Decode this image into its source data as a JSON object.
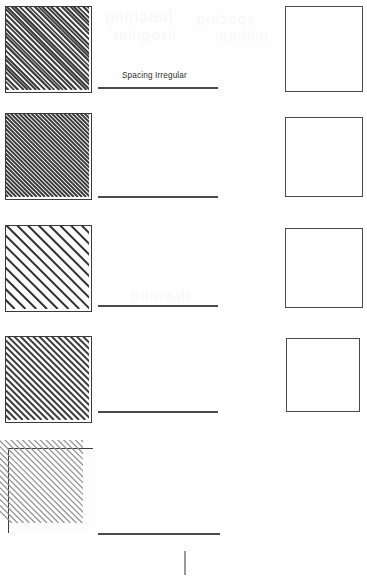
{
  "page": {
    "background_color": "#fefefe",
    "width": 367,
    "height": 576
  },
  "labels": [
    {
      "id": "spacing-irregular",
      "text": "Spacing Irregular",
      "x": 122,
      "y": 72,
      "color": "#2e2e2e"
    }
  ],
  "samples": [
    {
      "id": "sample-1",
      "name": "hatch-sample-1",
      "x": 5,
      "y": 6,
      "size": 87,
      "angle": 45,
      "spacing": 4.6,
      "line_width": 2.0,
      "line_color": "#3a3a3a",
      "fill_color": "#fbfbfb",
      "border_color": "#3b3b3b",
      "irregular": true,
      "overshoot": 0,
      "description": "Dense diagonal hatching with irregular spacing"
    },
    {
      "id": "sample-2",
      "name": "hatch-sample-2",
      "x": 5,
      "y": 113,
      "size": 87,
      "angle": 45,
      "spacing": 4.2,
      "line_width": 2.0,
      "line_color": "#3a3a3a",
      "fill_color": "#fbfbfb",
      "border_color": "#3b3b3b",
      "irregular": false,
      "overshoot": 0,
      "description": "Dense uniform diagonal hatching"
    },
    {
      "id": "sample-3",
      "name": "hatch-sample-3",
      "x": 5,
      "y": 225,
      "size": 87,
      "angle": 45,
      "spacing": 11.0,
      "line_width": 2.0,
      "line_color": "#2f2f2f",
      "fill_color": "#fbfbfb",
      "border_color": "#3b3b3b",
      "irregular": false,
      "overshoot": 0,
      "description": "Wide-spaced uniform diagonal hatching"
    },
    {
      "id": "sample-4",
      "name": "hatch-sample-4",
      "x": 5,
      "y": 336,
      "size": 87,
      "angle": 45,
      "spacing": 6.4,
      "line_width": 2.0,
      "line_color": "#3a3a3a",
      "fill_color": "#fbfbfb",
      "border_color": "#3b3b3b",
      "irregular": false,
      "overshoot": 0,
      "description": "Medium-spaced uniform diagonal hatching"
    },
    {
      "id": "sample-5",
      "name": "hatch-sample-5",
      "x": 8,
      "y": 448,
      "size": 85,
      "angle": 45,
      "spacing": 7.0,
      "line_width": 1.4,
      "line_color": "#8e8e8e",
      "fill_color": "#fdfdfd",
      "border_color": "#404040",
      "irregular": false,
      "overshoot": 7,
      "description": "Light hatching with lines overrunning the boundary"
    }
  ],
  "empty_boxes": [
    {
      "id": "answer-box-1",
      "name": "empty-answer-box-1",
      "x": 285,
      "y": 6,
      "width": 78,
      "height": 86
    },
    {
      "id": "answer-box-2",
      "name": "empty-answer-box-2",
      "x": 285,
      "y": 117,
      "width": 78,
      "height": 80
    },
    {
      "id": "answer-box-3",
      "name": "empty-answer-box-3",
      "x": 285,
      "y": 228,
      "width": 78,
      "height": 80
    },
    {
      "id": "answer-box-4",
      "name": "empty-answer-box-4",
      "x": 286,
      "y": 338,
      "width": 74,
      "height": 74
    }
  ],
  "rules": [
    {
      "id": "rule-1",
      "name": "answer-rule-1",
      "x": 98,
      "y": 87,
      "width": 120
    },
    {
      "id": "rule-2",
      "name": "answer-rule-2",
      "x": 98,
      "y": 196,
      "width": 120
    },
    {
      "id": "rule-3",
      "name": "answer-rule-3",
      "x": 98,
      "y": 305,
      "width": 120
    },
    {
      "id": "rule-4",
      "name": "answer-rule-4",
      "x": 98,
      "y": 411,
      "width": 120
    },
    {
      "id": "rule-5",
      "name": "answer-rule-5",
      "x": 98,
      "y": 533,
      "width": 122
    }
  ],
  "caret": {
    "name": "text-caret",
    "x": 184,
    "y": 551,
    "height": 24,
    "color": "#9a9a9a"
  },
  "ghosting": [
    {
      "text": "hatching",
      "x": 104,
      "y": 8,
      "size": 16
    },
    {
      "text": "spacing",
      "x": 196,
      "y": 10,
      "size": 15
    },
    {
      "text": "irregular",
      "x": 112,
      "y": 26,
      "size": 15
    },
    {
      "text": "uniform",
      "x": 214,
      "y": 28,
      "size": 14
    },
    {
      "text": "drawing",
      "x": 130,
      "y": 286,
      "size": 15
    }
  ]
}
